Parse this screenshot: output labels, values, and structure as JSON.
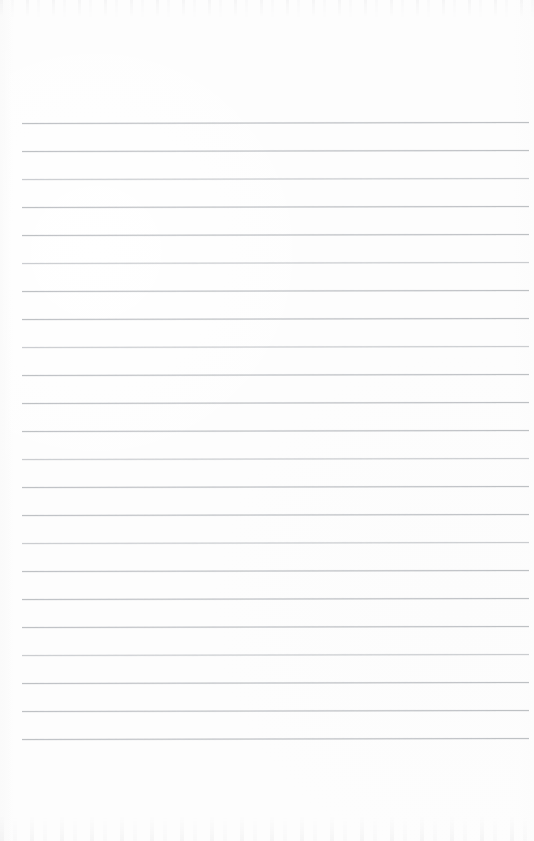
{
  "document": {
    "kind": "scanned-blank-ruled-page",
    "title": "Blank Ruled Notebook Page",
    "page_width": 534,
    "page_height": 841,
    "paper_color": "#fdfdfd",
    "has_text_content": false,
    "has_handwriting": false,
    "has_page_number": false,
    "has_margin_rule": false,
    "has_header": false,
    "has_footer": false
  },
  "ruling": {
    "line_color": "#b9bcc0",
    "line_thickness_px": 1,
    "line_count": 23,
    "first_line_y": 123,
    "line_spacing_px": 28,
    "line_start_x": 22,
    "line_end_x": 529,
    "tilt_px_over_width": -1,
    "line_y_positions": [
      123,
      151,
      179,
      207,
      235,
      263,
      291,
      319,
      347,
      375,
      403,
      431,
      459,
      487,
      515,
      543,
      571,
      599,
      627,
      655,
      683,
      711,
      739
    ],
    "line_opacities": [
      0.92,
      0.92,
      0.8,
      0.92,
      0.92,
      0.8,
      0.92,
      0.92,
      0.8,
      0.92,
      0.92,
      0.92,
      0.8,
      0.92,
      0.92,
      0.8,
      0.92,
      0.92,
      0.92,
      0.8,
      0.92,
      0.92,
      0.92
    ]
  },
  "margins": {
    "top_margin_px": 123,
    "bottom_margin_px": 102,
    "left_margin_px": 22,
    "right_margin_px": 5
  },
  "scan_artifacts": {
    "top_noise_band_height": 18,
    "bottom_noise_band_height": 26,
    "left_edge_band_width": 12,
    "noise_color": "#e2e2e4"
  }
}
